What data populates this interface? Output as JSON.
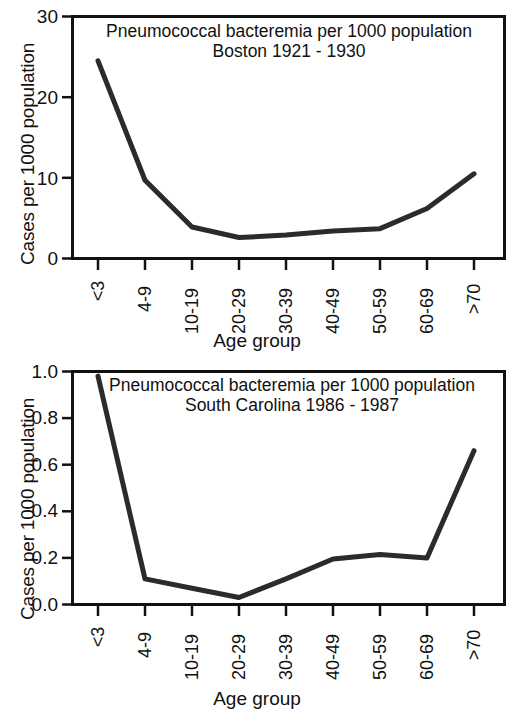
{
  "figure": {
    "background_color": "#ffffff",
    "line_color": "#2b2b2b",
    "axis_color": "#111111"
  },
  "chart_data": [
    {
      "type": "line",
      "panel": "top",
      "title": "Pneumococcal bacteremia per 1000 population",
      "subtitle": "Boston 1921 - 1930",
      "xlabel": "Age group",
      "ylabel": "Cases per 1000 population",
      "categories": [
        "<3",
        "4-9",
        "10-19",
        "20-29",
        "30-39",
        "40-49",
        "50-59",
        "60-69",
        ">70"
      ],
      "values": [
        24.5,
        9.7,
        3.9,
        2.6,
        2.9,
        3.4,
        3.7,
        6.2,
        10.5
      ],
      "ylim": [
        0,
        30
      ],
      "yticks": [
        0,
        10,
        20,
        30
      ],
      "ytick_labels": [
        "0",
        "10",
        "20",
        "30"
      ],
      "grid": false,
      "legend": "none"
    },
    {
      "type": "line",
      "panel": "bottom",
      "title": "Pneumococcal bacteremia per 1000 population",
      "subtitle": "South Carolina 1986 - 1987",
      "xlabel": "Age group",
      "ylabel": "Cases per 1000 population",
      "categories": [
        "<3",
        "4-9",
        "10-19",
        "20-29",
        "30-39",
        "40-49",
        "50-59",
        "60-69",
        ">70"
      ],
      "values": [
        0.98,
        0.11,
        0.07,
        0.03,
        0.11,
        0.195,
        0.215,
        0.2,
        0.66
      ],
      "ylim": [
        0,
        1.0
      ],
      "yticks": [
        0.0,
        0.2,
        0.4,
        0.6,
        0.8,
        1.0
      ],
      "ytick_labels": [
        "0.0",
        "0.2",
        "0.4",
        "0.6",
        "0.8",
        "1.0"
      ],
      "grid": false,
      "legend": "none"
    }
  ]
}
